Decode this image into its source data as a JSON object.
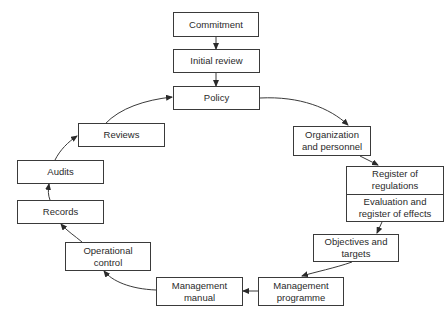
{
  "diagram": {
    "type": "cycle-flowchart",
    "nodes": {
      "commitment": "Commitment",
      "initial_review": "Initial review",
      "policy": "Policy",
      "organization": "Organization and personnel",
      "register_regulations": "Register of regulations",
      "evaluation_effects": "Evaluation and register of effects",
      "objectives": "Objectives and targets",
      "management_programme": "Management programme",
      "management_manual": "Management manual",
      "operational_control": "Operational control",
      "records": "Records",
      "audits": "Audits",
      "reviews": "Reviews"
    },
    "edges": [
      [
        "Commitment",
        "Initial review"
      ],
      [
        "Initial review",
        "Policy"
      ],
      [
        "Policy",
        "Organization and personnel"
      ],
      [
        "Organization and personnel",
        "Register of regulations"
      ],
      [
        "Evaluation and register of effects",
        "Objectives and targets"
      ],
      [
        "Objectives and targets",
        "Management programme"
      ],
      [
        "Management programme",
        "Management manual"
      ],
      [
        "Management manual",
        "Operational control"
      ],
      [
        "Operational control",
        "Records"
      ],
      [
        "Records",
        "Audits"
      ],
      [
        "Audits",
        "Reviews"
      ],
      [
        "Reviews",
        "Policy"
      ]
    ]
  }
}
